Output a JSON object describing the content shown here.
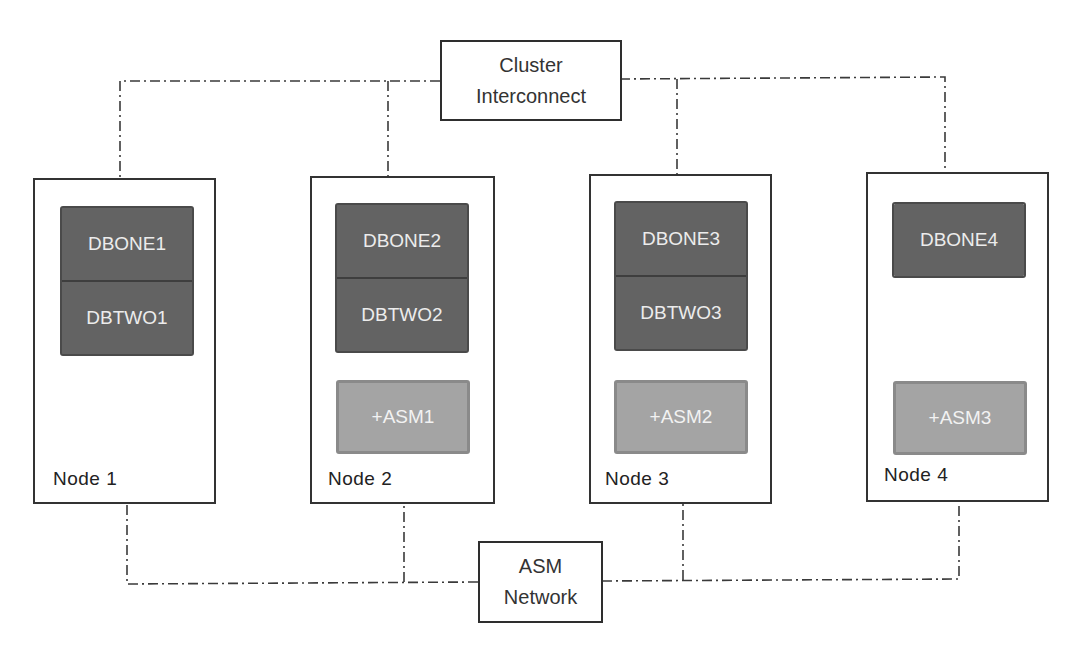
{
  "diagram": {
    "colors": {
      "line": "#3a3a3a",
      "db_fill": "#636363",
      "asm_fill": "#a4a4a4",
      "node_border": "#333333"
    },
    "cluster_interconnect": {
      "line1": "Cluster",
      "line2": "Interconnect"
    },
    "asm_network": {
      "line1": "ASM",
      "line2": "Network"
    },
    "nodes": [
      {
        "label": "Node 1",
        "databases": [
          "DBONE1",
          "DBTWO1"
        ],
        "asm": null
      },
      {
        "label": "Node 2",
        "databases": [
          "DBONE2",
          "DBTWO2"
        ],
        "asm": "+ASM1"
      },
      {
        "label": "Node 3",
        "databases": [
          "DBONE3",
          "DBTWO3"
        ],
        "asm": "+ASM2"
      },
      {
        "label": "Node 4",
        "databases": [
          "DBONE4"
        ],
        "asm": "+ASM3"
      }
    ]
  }
}
